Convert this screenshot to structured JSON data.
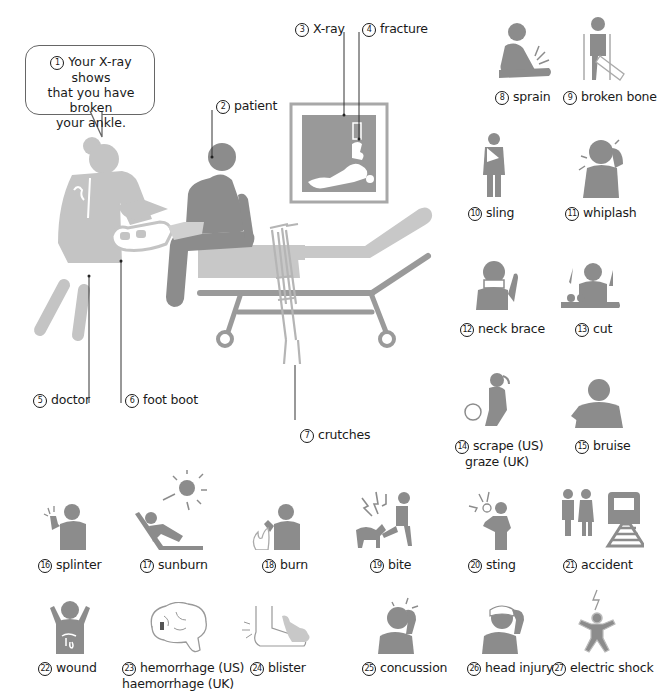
{
  "scene": {
    "speech_bubble": {
      "number": "1",
      "line1": "Your X-ray shows",
      "line2": "that you have broken",
      "line3": "your ankle."
    },
    "labels": [
      {
        "number": "2",
        "text": "patient"
      },
      {
        "number": "3",
        "text": "X-ray"
      },
      {
        "number": "4",
        "text": "fracture"
      },
      {
        "number": "5",
        "text": "doctor"
      },
      {
        "number": "6",
        "text": "foot boot"
      },
      {
        "number": "7",
        "text": "crutches"
      }
    ]
  },
  "icons": [
    {
      "number": "8",
      "text": "sprain"
    },
    {
      "number": "9",
      "text": "broken bone"
    },
    {
      "number": "10",
      "text": "sling"
    },
    {
      "number": "11",
      "text": "whiplash"
    },
    {
      "number": "12",
      "text": "neck brace"
    },
    {
      "number": "13",
      "text": "cut"
    },
    {
      "number": "14",
      "text": "scrape (US)",
      "text2": "graze (UK)"
    },
    {
      "number": "15",
      "text": "bruise"
    },
    {
      "number": "16",
      "text": "splinter"
    },
    {
      "number": "17",
      "text": "sunburn"
    },
    {
      "number": "18",
      "text": "burn"
    },
    {
      "number": "19",
      "text": "bite"
    },
    {
      "number": "20",
      "text": "sting"
    },
    {
      "number": "21",
      "text": "accident"
    },
    {
      "number": "22",
      "text": "wound"
    },
    {
      "number": "23",
      "text": "hemorrhage (US)",
      "text2": "haemorrhage (UK)"
    },
    {
      "number": "24",
      "text": "blister"
    },
    {
      "number": "25",
      "text": "concussion"
    },
    {
      "number": "26",
      "text": "head injury"
    },
    {
      "number": "27",
      "text": "electric shock"
    }
  ],
  "colors": {
    "figure_dark": "#8c8c8c",
    "figure_light": "#c4c4c4",
    "line": "#333333"
  }
}
